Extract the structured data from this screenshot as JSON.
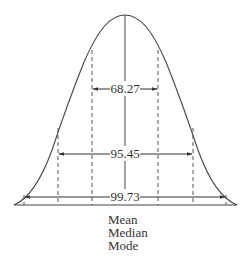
{
  "diagram": {
    "intervals": [
      {
        "label": "68.27",
        "sigma": 1
      },
      {
        "label": "95.45",
        "sigma": 2
      },
      {
        "label": "99.73",
        "sigma": 3
      }
    ],
    "center_labels": [
      "Mean",
      "Median",
      "Mode"
    ]
  },
  "colors": {
    "stroke": "#444444",
    "text": "#333333",
    "background": "#ffffff"
  }
}
